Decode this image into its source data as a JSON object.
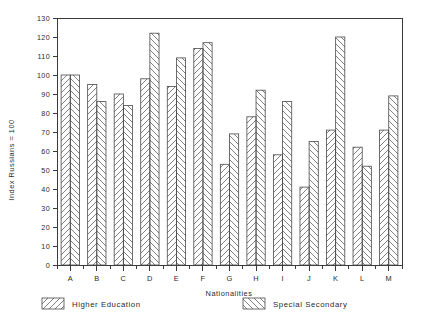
{
  "chart_data": {
    "type": "bar",
    "title": "",
    "xlabel": "Nationalities",
    "ylabel": "Index Russians = 100",
    "ylim": [
      0,
      130
    ],
    "ytick_step": 10,
    "yticks": [
      0,
      10,
      20,
      30,
      40,
      50,
      60,
      70,
      80,
      90,
      100,
      110,
      120,
      130
    ],
    "grid": false,
    "legend_position": "bottom",
    "categories": [
      "A",
      "B",
      "C",
      "D",
      "E",
      "F",
      "G",
      "H",
      "I",
      "J",
      "K",
      "L",
      "M"
    ],
    "series": [
      {
        "name": "Higher Education",
        "hatch": "forward-diagonal",
        "values": [
          100,
          95,
          90,
          98,
          94,
          114,
          53,
          78,
          58,
          41,
          71,
          62,
          71
        ]
      },
      {
        "name": "Special Secondary",
        "hatch": "backward-diagonal",
        "values": [
          100,
          86,
          84,
          122,
          109,
          117,
          69,
          92,
          86,
          65,
          120,
          52,
          89
        ]
      }
    ]
  },
  "legend": {
    "entries": [
      {
        "label": "Higher Education"
      },
      {
        "label": "Special Secondary"
      }
    ]
  },
  "colors": {
    "ink": "#2b2b2b",
    "axis": "#3a3a3a",
    "bar_stroke": "#4a4a4a",
    "background": "#ffffff"
  }
}
